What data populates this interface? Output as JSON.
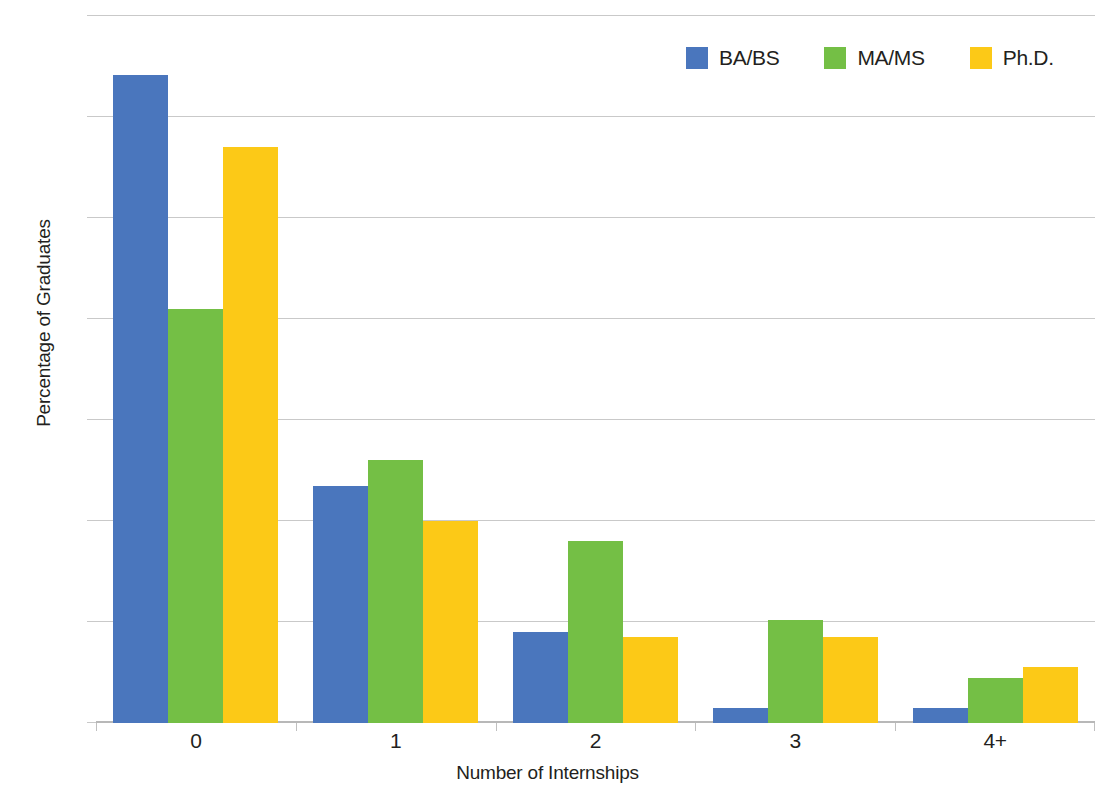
{
  "chart_data": {
    "type": "bar",
    "title": "",
    "xlabel": "Number of Internships",
    "ylabel": "Percentage of Graduates",
    "categories": [
      "0",
      "1",
      "2",
      "3",
      "4+"
    ],
    "series": [
      {
        "name": "BA/BS",
        "color": "#4a76bd",
        "values": [
          64.2,
          23.5,
          9.0,
          1.5,
          1.5
        ]
      },
      {
        "name": "MA/MS",
        "color": "#74bf45",
        "values": [
          41.0,
          26.0,
          18.0,
          10.2,
          4.5
        ]
      },
      {
        "name": "Ph.D.",
        "color": "#fcc917",
        "values": [
          57.0,
          20.0,
          8.5,
          8.5,
          5.5
        ]
      }
    ],
    "ylim": [
      0,
      70
    ],
    "y_ticks": [
      0,
      10,
      20,
      30,
      40,
      50,
      60,
      70
    ],
    "y_tick_labels": [
      "0%",
      "10%",
      "20%",
      "30%",
      "40%",
      "50%",
      "60%",
      "70%"
    ],
    "grid": true,
    "legend_position": "top-right",
    "background_color": "#ffffff",
    "gridline_color": "#c9c9c9"
  }
}
